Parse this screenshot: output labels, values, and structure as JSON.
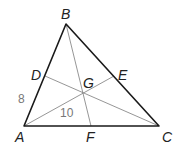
{
  "diagram": {
    "type": "triangle-medians",
    "vertices": {
      "A": "A",
      "B": "B",
      "C": "C"
    },
    "midpoints": {
      "D": "D",
      "E": "E",
      "F": "F"
    },
    "centroid": "G",
    "measures": {
      "AD": "8",
      "AG": "10"
    },
    "colors": {
      "edge": "#1a1a1a",
      "median": "#8a8a8a",
      "measure": "#777777"
    }
  }
}
